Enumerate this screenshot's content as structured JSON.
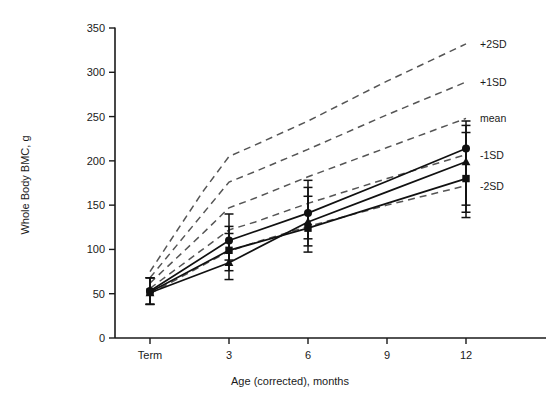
{
  "chart_data": {
    "type": "line",
    "title": "",
    "xlabel": "Age (corrected), months",
    "ylabel": "Whole Body BMC, g",
    "xlim": [
      -1.2,
      13.5
    ],
    "ylim": [
      0,
      350
    ],
    "yticks": [
      0,
      50,
      100,
      150,
      200,
      250,
      300,
      350
    ],
    "ytick_labels": [
      "0",
      "50",
      "100",
      "150",
      "200",
      "250",
      "300",
      "350"
    ],
    "xticks": [
      0,
      3,
      6,
      9,
      12
    ],
    "xtick_labels": [
      "Term",
      "3",
      "6",
      "9",
      "12"
    ],
    "grid": false,
    "legend_position": "right-inline",
    "series": [
      {
        "name": "group-circle",
        "marker": "circle",
        "linestyle": "solid",
        "color": "#111111",
        "x": [
          0,
          3,
          6,
          9,
          12
        ],
        "values": [
          53,
          110,
          141,
          177,
          214
        ],
        "errors_low": [
          38,
          88,
          112,
          null,
          150
        ],
        "errors_high": [
          68,
          140,
          178,
          null,
          245
        ]
      },
      {
        "name": "group-square",
        "marker": "square",
        "linestyle": "solid",
        "color": "#111111",
        "x": [
          0,
          3,
          6,
          9,
          12
        ],
        "values": [
          52,
          99,
          124,
          152,
          180
        ],
        "errors_low": [
          38,
          76,
          97,
          null,
          136
        ],
        "errors_high": [
          68,
          126,
          160,
          null,
          232
        ]
      },
      {
        "name": "group-triangle",
        "marker": "triangle",
        "linestyle": "solid",
        "color": "#111111",
        "x": [
          0,
          3,
          6,
          9,
          12
        ],
        "values": [
          51,
          85,
          131,
          165,
          199
        ],
        "errors_low": [
          38,
          66,
          104,
          null,
          142
        ],
        "errors_high": [
          68,
          118,
          170,
          null,
          240
        ]
      }
    ],
    "reference_curves": [
      {
        "name": "+2SD",
        "label": "+2SD",
        "linestyle": "dashed",
        "color": "#555555",
        "x": [
          0,
          1,
          2,
          3,
          4,
          6,
          9,
          12
        ],
        "values": [
          75,
          120,
          165,
          205,
          218,
          245,
          290,
          332
        ]
      },
      {
        "name": "+1SD",
        "label": "+1SD",
        "linestyle": "dashed",
        "color": "#555555",
        "x": [
          0,
          1,
          2,
          3,
          4,
          6,
          9,
          12
        ],
        "values": [
          68,
          104,
          140,
          176,
          188,
          213,
          252,
          289
        ]
      },
      {
        "name": "mean",
        "label": "mean",
        "linestyle": "dashed",
        "color": "#555555",
        "x": [
          0,
          1,
          2,
          3,
          4,
          6,
          9,
          12
        ],
        "values": [
          62,
          90,
          118,
          147,
          158,
          182,
          215,
          248
        ]
      },
      {
        "name": "-1SD",
        "label": "-1SD",
        "linestyle": "dashed",
        "color": "#555555",
        "x": [
          0,
          1,
          2,
          3,
          4,
          6,
          9,
          12
        ],
        "values": [
          56,
          78,
          100,
          122,
          131,
          152,
          180,
          207
        ]
      },
      {
        "name": "-2SD",
        "label": "-2SD",
        "linestyle": "dashed",
        "color": "#555555",
        "x": [
          0,
          1,
          2,
          3,
          4,
          6,
          9,
          12
        ],
        "values": [
          50,
          66,
          82,
          98,
          108,
          126,
          150,
          172
        ]
      }
    ],
    "sd_labels": [
      {
        "text": "+2SD",
        "y_value": 332
      },
      {
        "text": "+1SD",
        "y_value": 289
      },
      {
        "text": "mean",
        "y_value": 248
      },
      {
        "text": "-1SD",
        "y_value": 207
      },
      {
        "text": "-2SD",
        "y_value": 172
      }
    ]
  }
}
